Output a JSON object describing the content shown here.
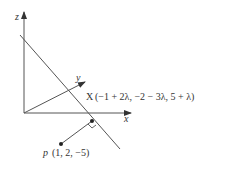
{
  "diagram": {
    "type": "3d-coordinate-geometry",
    "axes": {
      "x_label": "x",
      "y_label": "y",
      "z_label": "z"
    },
    "line_point": {
      "name": "X",
      "coords": "(−1 + 2λ, −2 − 3λ, 5 + λ)"
    },
    "external_point": {
      "name": "p",
      "coords": "(1, 2, −5)"
    },
    "right_angle_marker": true,
    "colors": {
      "stroke": "#555555",
      "text": "#333333",
      "point": "#222222"
    }
  }
}
